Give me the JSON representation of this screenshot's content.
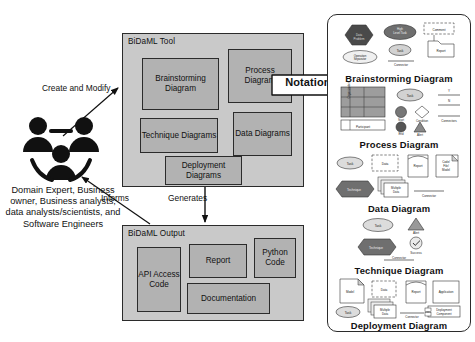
{
  "diagram": {
    "colors": {
      "outer_box_fill": "#c9c9c9",
      "inner_box_fill": "#b2b2b2",
      "stroke": "#2b2b2b",
      "panel_fill": "#ffffff",
      "background": "#ffffff"
    }
  },
  "actors": {
    "icon": "three-people-group-icon",
    "caption": "Domain Expert, Business owner, Business analysts, data analysts/scientists, and Software Engineers"
  },
  "connectors": {
    "create_and_modify": "Create and Modify",
    "informs": "Informs",
    "generates": "Generates"
  },
  "notations_arrow": {
    "label": "Notations",
    "icon": "right-block-arrow-icon"
  },
  "tool": {
    "title": "BiDaML Tool",
    "items": [
      {
        "label": "Brainstorming Diagram"
      },
      {
        "label": "Process Diagram"
      },
      {
        "label": "Technique Diagrams"
      },
      {
        "label": "Data Diagrams"
      },
      {
        "label": "Deployment Diagrams"
      }
    ]
  },
  "output": {
    "title": "BiDaML Output",
    "items": [
      {
        "label": "API Access Code"
      },
      {
        "label": "Report"
      },
      {
        "label": "Python Code"
      },
      {
        "label": "Documentation"
      }
    ]
  },
  "notations_panel": {
    "sections": [
      {
        "title": "Brainstorming Diagram",
        "elements": [
          "Data Problem",
          "High Level Task",
          "Task",
          "Operation Separator",
          "Connector",
          "Comment",
          "Report"
        ]
      },
      {
        "title": "Process Diagram",
        "elements": [
          "Organization",
          "Participant",
          "Task",
          "Start",
          "End",
          "Condition",
          "Alert",
          "Connectors"
        ]
      },
      {
        "title": "Data Diagram",
        "elements": [
          "Task",
          "Data",
          "Report",
          "Code/File/Model",
          "Technique",
          "Multiple Data",
          "Connector"
        ]
      },
      {
        "title": "Technique Diagram",
        "elements": [
          "Task",
          "Alert",
          "Technique",
          "Success",
          "Connector"
        ]
      },
      {
        "title": "Deployment Diagram",
        "elements": [
          "Model",
          "Data",
          "Report",
          "Application",
          "Task",
          "Multiple Data",
          "Connector",
          "Deployment Component"
        ]
      }
    ]
  }
}
